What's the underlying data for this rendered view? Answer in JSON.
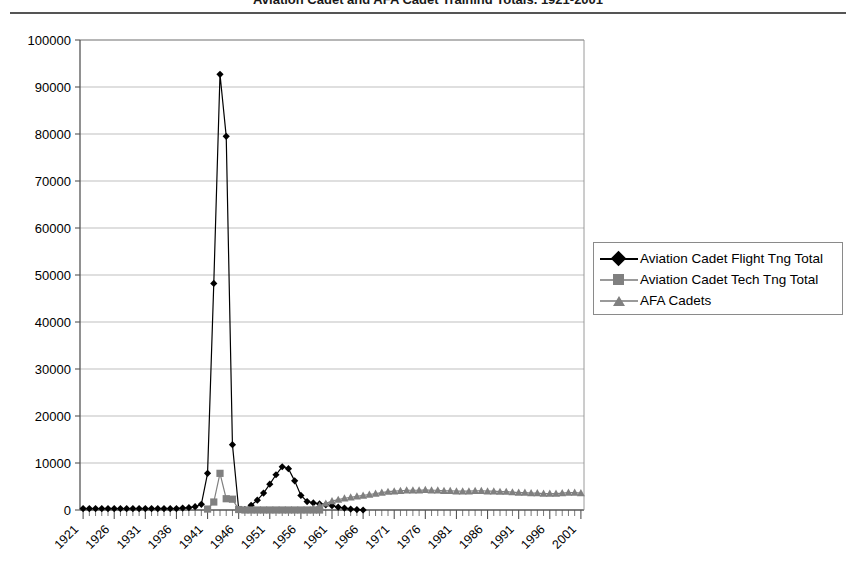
{
  "header": {
    "title_clipped": "Aviation Cadet and AFA Cadet Training Totals, 1921-2001",
    "rule_color": "#555555"
  },
  "legend": {
    "position": "right-middle",
    "entries": [
      {
        "label": "Aviation Cadet Flight Tng Total",
        "color": "#000000",
        "marker": "diamond-marker-icon"
      },
      {
        "label": "Aviation Cadet Tech Tng Total",
        "color": "#808080",
        "marker": "square-marker-icon"
      },
      {
        "label": "AFA Cadets",
        "color": "#808080",
        "marker": "triangle-marker-icon"
      }
    ]
  },
  "chart_data": {
    "type": "line",
    "title": "",
    "xlabel": "",
    "ylabel": "",
    "ylim": [
      0,
      100000
    ],
    "ytick_step": 10000,
    "ytick_labels": [
      "0",
      "10000",
      "20000",
      "30000",
      "40000",
      "50000",
      "60000",
      "70000",
      "80000",
      "90000",
      "100000"
    ],
    "xlim": [
      1921,
      2002
    ],
    "xtick_step": 5,
    "xtick_labels": [
      "1921",
      "1926",
      "1931",
      "1936",
      "1941",
      "1946",
      "1951",
      "1956",
      "1961",
      "1966",
      "1971",
      "1976",
      "1981",
      "1986",
      "1991",
      "1996",
      "2001"
    ],
    "minor_xticks_every": 1,
    "grid": "horizontal",
    "x": [
      1921,
      1922,
      1923,
      1924,
      1925,
      1926,
      1927,
      1928,
      1929,
      1930,
      1931,
      1932,
      1933,
      1934,
      1935,
      1936,
      1937,
      1938,
      1939,
      1940,
      1941,
      1942,
      1943,
      1944,
      1945,
      1946,
      1947,
      1948,
      1949,
      1950,
      1951,
      1952,
      1953,
      1954,
      1955,
      1956,
      1957,
      1958,
      1959,
      1960,
      1961,
      1962,
      1963,
      1964,
      1965,
      1966,
      1967,
      1968,
      1969,
      1970,
      1971,
      1972,
      1973,
      1974,
      1975,
      1976,
      1977,
      1978,
      1979,
      1980,
      1981,
      1982,
      1983,
      1984,
      1985,
      1986,
      1987,
      1988,
      1989,
      1990,
      1991,
      1992,
      1993,
      1994,
      1995,
      1996,
      1997,
      1998,
      1999,
      2000,
      2001
    ],
    "series": [
      {
        "name": "Aviation Cadet Flight Tng Total",
        "color": "#000000",
        "marker": "diamond",
        "values": [
          300,
          300,
          300,
          300,
          300,
          300,
          300,
          300,
          300,
          300,
          300,
          300,
          300,
          300,
          300,
          300,
          400,
          500,
          700,
          1200,
          7800,
          48200,
          92700,
          79500,
          13900,
          200,
          100,
          1000,
          2100,
          3600,
          5500,
          7500,
          9200,
          8800,
          6200,
          3100,
          1800,
          1500,
          1300,
          1100,
          900,
          600,
          400,
          200,
          100,
          0,
          null,
          null,
          null,
          null,
          null,
          null,
          null,
          null,
          null,
          null,
          null,
          null,
          null,
          null,
          null,
          null,
          null,
          null,
          null,
          null,
          null,
          null,
          null,
          null,
          null,
          null,
          null,
          null,
          null,
          null,
          null,
          null,
          null,
          null,
          null
        ]
      },
      {
        "name": "Aviation Cadet Tech Tng Total",
        "color": "#808080",
        "marker": "square",
        "values": [
          null,
          null,
          null,
          null,
          null,
          null,
          null,
          null,
          null,
          null,
          null,
          null,
          null,
          null,
          null,
          null,
          null,
          null,
          null,
          null,
          200,
          1700,
          7800,
          2400,
          2300,
          100,
          0,
          0,
          0,
          0,
          0,
          0,
          0,
          0,
          0,
          0,
          0,
          0,
          0,
          null,
          null,
          null,
          null,
          null,
          null,
          null,
          null,
          null,
          null,
          null,
          null,
          null,
          null,
          null,
          null,
          null,
          null,
          null,
          null,
          null,
          null,
          null,
          null,
          null,
          null,
          null,
          null,
          null,
          null,
          null,
          null,
          null,
          null,
          null,
          null,
          null,
          null,
          null,
          null,
          null,
          null
        ]
      },
      {
        "name": "AFA Cadets",
        "color": "#808080",
        "marker": "triangle",
        "values": [
          null,
          null,
          null,
          null,
          null,
          null,
          null,
          null,
          null,
          null,
          null,
          null,
          null,
          null,
          null,
          null,
          null,
          null,
          null,
          null,
          null,
          null,
          null,
          null,
          null,
          null,
          null,
          null,
          null,
          null,
          null,
          null,
          null,
          null,
          null,
          null,
          null,
          300,
          900,
          1400,
          1900,
          2200,
          2500,
          2700,
          2900,
          3100,
          3300,
          3500,
          3700,
          3900,
          4000,
          4100,
          4200,
          4200,
          4200,
          4300,
          4200,
          4200,
          4100,
          4100,
          4000,
          4000,
          4000,
          4100,
          4100,
          4000,
          4000,
          3900,
          3900,
          3800,
          3700,
          3700,
          3600,
          3600,
          3500,
          3500,
          3500,
          3600,
          3700,
          3700,
          3600
        ]
      }
    ]
  },
  "plot_geometry": {
    "left": 80,
    "right": 584,
    "top": 40,
    "bottom": 510
  }
}
